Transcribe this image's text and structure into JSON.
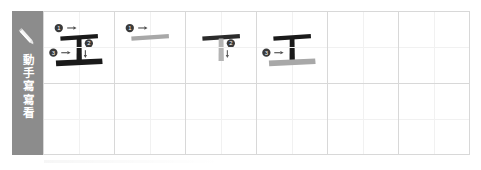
{
  "sidebar": {
    "icon": "pencil-icon",
    "label": "動手寫寫看",
    "background_color": "#8c8c8c",
    "text_color": "#ffffff"
  },
  "colors": {
    "stroke_done": "#1a1a1a",
    "stroke_current": "#a8a8a8",
    "grid_line": "#d8d8d8",
    "grid_guide": "#f1f1f1",
    "badge_fill": "#3a3a3a",
    "badge_text": "#ffffff"
  },
  "character": "工",
  "grid": {
    "columns": 6,
    "rows": 2
  },
  "cells": [
    {
      "index": 1,
      "name": "full-character",
      "state": "complete",
      "strokes": [
        {
          "number": "1",
          "type": "horizontal",
          "state": "done"
        },
        {
          "number": "2",
          "type": "vertical",
          "state": "done"
        },
        {
          "number": "3",
          "type": "horizontal",
          "state": "done"
        }
      ],
      "markers": [
        "1",
        "2",
        "3"
      ],
      "arrows": [
        "right",
        "down",
        "right"
      ]
    },
    {
      "index": 2,
      "name": "stroke-1-step",
      "state": "step",
      "strokes": [
        {
          "number": "1",
          "type": "horizontal",
          "state": "current"
        }
      ],
      "markers": [
        "1"
      ],
      "arrows": [
        "right"
      ]
    },
    {
      "index": 3,
      "name": "stroke-2-step",
      "state": "step",
      "strokes": [
        {
          "number": "1",
          "type": "horizontal",
          "state": "done"
        },
        {
          "number": "2",
          "type": "vertical",
          "state": "current"
        }
      ],
      "markers": [
        "2"
      ],
      "arrows": [
        "down"
      ]
    },
    {
      "index": 4,
      "name": "stroke-3-step",
      "state": "step",
      "strokes": [
        {
          "number": "1",
          "type": "horizontal",
          "state": "done"
        },
        {
          "number": "2",
          "type": "vertical",
          "state": "done"
        },
        {
          "number": "3",
          "type": "horizontal",
          "state": "current"
        }
      ],
      "markers": [
        "3"
      ],
      "arrows": [
        "right"
      ]
    },
    {
      "index": 5,
      "name": "blank-practice-cell",
      "state": "empty",
      "strokes": [],
      "markers": [],
      "arrows": []
    },
    {
      "index": 6,
      "name": "blank-practice-cell",
      "state": "empty",
      "strokes": [],
      "markers": [],
      "arrows": []
    },
    {
      "index": 7,
      "name": "blank-practice-cell",
      "state": "empty",
      "strokes": [],
      "markers": [],
      "arrows": []
    },
    {
      "index": 8,
      "name": "blank-practice-cell",
      "state": "empty",
      "strokes": [],
      "markers": [],
      "arrows": []
    },
    {
      "index": 9,
      "name": "blank-practice-cell",
      "state": "empty",
      "strokes": [],
      "markers": [],
      "arrows": []
    },
    {
      "index": 10,
      "name": "blank-practice-cell",
      "state": "empty",
      "strokes": [],
      "markers": [],
      "arrows": []
    },
    {
      "index": 11,
      "name": "blank-practice-cell",
      "state": "empty",
      "strokes": [],
      "markers": [],
      "arrows": []
    },
    {
      "index": 12,
      "name": "blank-practice-cell",
      "state": "empty",
      "strokes": [],
      "markers": [],
      "arrows": []
    }
  ]
}
